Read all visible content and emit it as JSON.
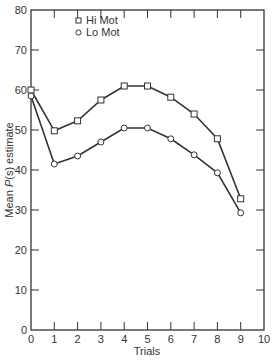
{
  "chart_data": {
    "type": "line",
    "title": "",
    "xlabel": "Trials",
    "ylabel": "Mean P(s) estimate",
    "ylabel_parts": {
      "prefix": "Mean ",
      "italic": "P",
      "suffix": "(s) estimate"
    },
    "xlim": [
      0,
      10
    ],
    "ylim": [
      0,
      80
    ],
    "x_ticks": [
      0,
      1,
      2,
      3,
      4,
      5,
      6,
      7,
      8,
      9,
      10
    ],
    "y_ticks": [
      0,
      10,
      20,
      30,
      40,
      50,
      60,
      70,
      80
    ],
    "grid": false,
    "legend_position": "upper-left-inside",
    "x": [
      0,
      1,
      2,
      3,
      4,
      5,
      6,
      7,
      8,
      9
    ],
    "series": [
      {
        "name": "Hi Mot",
        "marker": "square",
        "values": [
          60,
          49.8,
          52.3,
          57.5,
          61,
          61,
          58.2,
          54,
          47.8,
          32.8
        ]
      },
      {
        "name": "Lo Mot",
        "marker": "circle",
        "values": [
          58.5,
          41.5,
          43.5,
          47,
          50.5,
          50.5,
          47.8,
          43.8,
          39.3,
          29.3
        ]
      }
    ]
  },
  "legend": {
    "items": [
      {
        "label": "Hi Mot",
        "marker": "square"
      },
      {
        "label": "Lo Mot",
        "marker": "circle"
      }
    ]
  }
}
